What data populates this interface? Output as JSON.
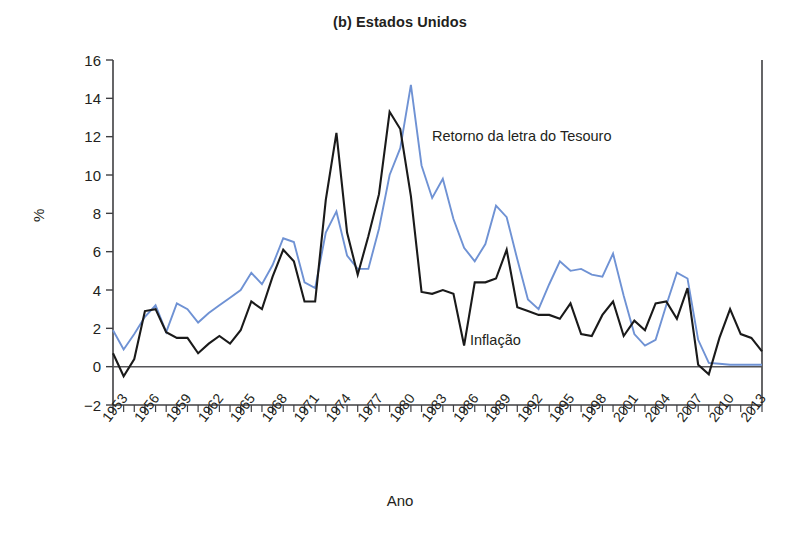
{
  "chart_data": {
    "type": "line",
    "title": "(b) Estados Unidos",
    "xlabel": "Ano",
    "ylabel": "%",
    "ylim": [
      -2,
      16
    ],
    "xlim": [
      1953,
      2014
    ],
    "yticks": [
      -2,
      0,
      2,
      4,
      6,
      8,
      10,
      12,
      14,
      16
    ],
    "xticks": [
      1953,
      1956,
      1959,
      1962,
      1965,
      1968,
      1971,
      1974,
      1977,
      1980,
      1983,
      1986,
      1989,
      1992,
      1995,
      1998,
      2001,
      2004,
      2007,
      2010,
      2013
    ],
    "grid": false,
    "legend_position": "inline-annotations",
    "x": [
      1953,
      1954,
      1955,
      1956,
      1957,
      1958,
      1959,
      1960,
      1961,
      1962,
      1963,
      1964,
      1965,
      1966,
      1967,
      1968,
      1969,
      1970,
      1971,
      1972,
      1973,
      1974,
      1975,
      1976,
      1977,
      1978,
      1979,
      1980,
      1981,
      1982,
      1983,
      1984,
      1985,
      1986,
      1987,
      1988,
      1989,
      1990,
      1991,
      1992,
      1993,
      1994,
      1995,
      1996,
      1997,
      1998,
      1999,
      2000,
      2001,
      2002,
      2003,
      2004,
      2005,
      2006,
      2007,
      2008,
      2009,
      2010,
      2011,
      2012,
      2013,
      2014
    ],
    "series": [
      {
        "name": "Retorno da letra do Tesouro",
        "color": "#6f92d4",
        "values": [
          1.9,
          0.9,
          1.7,
          2.6,
          3.2,
          1.8,
          3.3,
          3.0,
          2.3,
          2.8,
          3.2,
          3.6,
          4.0,
          4.9,
          4.3,
          5.3,
          6.7,
          6.5,
          4.4,
          4.1,
          7.0,
          8.1,
          5.8,
          5.1,
          5.1,
          7.2,
          10.0,
          11.4,
          14.7,
          10.5,
          8.8,
          9.8,
          7.7,
          6.2,
          5.5,
          6.4,
          8.4,
          7.8,
          5.6,
          3.5,
          3.0,
          4.3,
          5.5,
          5.0,
          5.1,
          4.8,
          4.7,
          5.9,
          3.7,
          1.7,
          1.1,
          1.4,
          3.2,
          4.9,
          4.6,
          1.4,
          0.2,
          0.15,
          0.1,
          0.1,
          0.1,
          0.1
        ]
      },
      {
        "name": "Inflação",
        "color": "#1a1a1a",
        "values": [
          0.7,
          -0.5,
          0.4,
          2.9,
          3.0,
          1.8,
          1.5,
          1.5,
          0.7,
          1.2,
          1.6,
          1.2,
          1.9,
          3.4,
          3.0,
          4.7,
          6.1,
          5.5,
          3.4,
          3.4,
          8.7,
          12.2,
          7.0,
          4.8,
          6.8,
          9.0,
          13.3,
          12.4,
          8.9,
          3.9,
          3.8,
          4.0,
          3.8,
          1.1,
          4.4,
          4.4,
          4.6,
          6.1,
          3.1,
          2.9,
          2.7,
          2.7,
          2.5,
          3.3,
          1.7,
          1.6,
          2.7,
          3.4,
          1.6,
          2.4,
          1.9,
          3.3,
          3.4,
          2.5,
          4.1,
          0.1,
          -0.4,
          1.5,
          3.0,
          1.7,
          1.5,
          0.8
        ]
      }
    ]
  },
  "annotations": {
    "tbill_label": "Retorno da letra do Tesouro",
    "inflation_label": "Inflação"
  }
}
